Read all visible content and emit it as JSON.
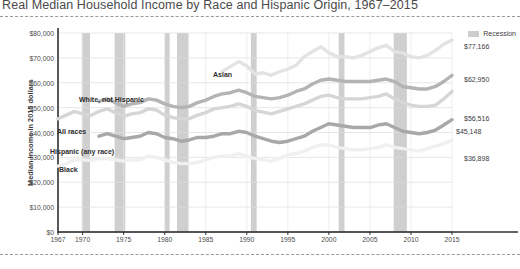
{
  "chart_data": {
    "type": "line",
    "title": "Real Median Household Income by Race and Hispanic Origin, 1967–2015",
    "xlabel": "",
    "ylabel": "Median income in 2015 dollars",
    "xlim": [
      1967,
      2015
    ],
    "ylim": [
      0,
      80000
    ],
    "grid": true,
    "legend_position": "top-right",
    "legend": [
      {
        "label": "Recession",
        "color": "#cdcdcd",
        "kind": "band"
      }
    ],
    "ytick_labels": [
      "$0",
      "$10,000",
      "$20,000",
      "$30,000",
      "$40,000",
      "$50,000",
      "$60,000",
      "$70,000",
      "$80,000"
    ],
    "ytick_values": [
      0,
      10000,
      20000,
      30000,
      40000,
      50000,
      60000,
      70000,
      80000
    ],
    "xtick_labels": [
      "1967",
      "1970",
      "1975",
      "1980",
      "1985",
      "1990",
      "1995",
      "2000",
      "2005",
      "2010",
      "2015"
    ],
    "xtick_values": [
      1967,
      1970,
      1975,
      1980,
      1985,
      1990,
      1995,
      2000,
      2005,
      2010,
      2015
    ],
    "recessions": [
      {
        "start": 1969.9,
        "end": 1970.9
      },
      {
        "start": 1973.9,
        "end": 1975.2
      },
      {
        "start": 1980.0,
        "end": 1980.6
      },
      {
        "start": 1981.5,
        "end": 1982.9
      },
      {
        "start": 1990.5,
        "end": 1991.2
      },
      {
        "start": 2001.2,
        "end": 2001.9
      },
      {
        "start": 2007.9,
        "end": 2009.5
      }
    ],
    "series": [
      {
        "name": "Asian",
        "color": "#e3e3e3",
        "end_value": 77166,
        "end_label": "$77,166",
        "x": [
          1987,
          1988,
          1989,
          1990,
          1991,
          1992,
          1993,
          1994,
          1995,
          1996,
          1997,
          1998,
          1999,
          2000,
          2001,
          2002,
          2003,
          2004,
          2005,
          2006,
          2007,
          2008,
          2009,
          2010,
          2011,
          2012,
          2013,
          2014,
          2015
        ],
        "values": [
          64500,
          66500,
          68500,
          66800,
          63500,
          64000,
          63000,
          64500,
          65500,
          67000,
          70500,
          72500,
          74500,
          72000,
          70500,
          70500,
          70000,
          71000,
          72500,
          74000,
          75000,
          72500,
          72000,
          70500,
          70000,
          71000,
          73000,
          75500,
          77166
        ]
      },
      {
        "name": "White, not Hispanic",
        "color": "#b4b4b4",
        "end_value": 62950,
        "end_label": "$62,950",
        "x": [
          1972,
          1973,
          1974,
          1975,
          1976,
          1977,
          1978,
          1979,
          1980,
          1981,
          1982,
          1983,
          1984,
          1985,
          1986,
          1987,
          1988,
          1989,
          1990,
          1991,
          1992,
          1993,
          1994,
          1995,
          1996,
          1997,
          1998,
          1999,
          2000,
          2001,
          2002,
          2003,
          2004,
          2005,
          2006,
          2007,
          2008,
          2009,
          2010,
          2011,
          2012,
          2013,
          2014,
          2015
        ],
        "values": [
          52500,
          53500,
          52000,
          50500,
          51500,
          52000,
          53500,
          53000,
          51500,
          50500,
          50000,
          50500,
          52000,
          53000,
          54500,
          55500,
          56000,
          57000,
          56000,
          54500,
          54000,
          53500,
          54000,
          55000,
          56500,
          57500,
          59500,
          61000,
          61500,
          61000,
          60500,
          60500,
          60500,
          60500,
          61000,
          61500,
          60500,
          58500,
          58000,
          57500,
          57500,
          58500,
          60500,
          62950
        ]
      },
      {
        "name": "All races",
        "color": "#d6d6d6",
        "end_value": 56516,
        "end_label": "$56,516",
        "x": [
          1967,
          1968,
          1969,
          1970,
          1971,
          1972,
          1973,
          1974,
          1975,
          1976,
          1977,
          1978,
          1979,
          1980,
          1981,
          1982,
          1983,
          1984,
          1985,
          1986,
          1987,
          1988,
          1989,
          1990,
          1991,
          1992,
          1993,
          1994,
          1995,
          1996,
          1997,
          1998,
          1999,
          2000,
          2001,
          2002,
          2003,
          2004,
          2005,
          2006,
          2007,
          2008,
          2009,
          2010,
          2011,
          2012,
          2013,
          2014,
          2015
        ],
        "values": [
          45500,
          47000,
          48500,
          47500,
          46800,
          48500,
          49500,
          48000,
          46500,
          47500,
          48000,
          49500,
          49000,
          47000,
          46000,
          45500,
          45500,
          47000,
          48000,
          49500,
          50000,
          50500,
          51500,
          50500,
          48800,
          48200,
          47500,
          48500,
          49500,
          50500,
          51500,
          53000,
          54500,
          55000,
          54000,
          53500,
          53500,
          53500,
          54000,
          54500,
          55500,
          53500,
          52000,
          51000,
          50500,
          50500,
          51000,
          53500,
          56516
        ]
      },
      {
        "name": "Hispanic (any race)",
        "color": "#a8a8a8",
        "end_value": 45148,
        "end_label": "$45,148",
        "x": [
          1972,
          1973,
          1974,
          1975,
          1976,
          1977,
          1978,
          1979,
          1980,
          1981,
          1982,
          1983,
          1984,
          1985,
          1986,
          1987,
          1988,
          1989,
          1990,
          1991,
          1992,
          1993,
          1994,
          1995,
          1996,
          1997,
          1998,
          1999,
          2000,
          2001,
          2002,
          2003,
          2004,
          2005,
          2006,
          2007,
          2008,
          2009,
          2010,
          2011,
          2012,
          2013,
          2014,
          2015
        ],
        "values": [
          38500,
          39500,
          38500,
          37500,
          38000,
          38500,
          40000,
          39500,
          38000,
          37500,
          36500,
          37000,
          38000,
          38000,
          38500,
          39500,
          39500,
          40500,
          40000,
          38500,
          37500,
          36500,
          36000,
          36500,
          37500,
          38500,
          40500,
          42000,
          43500,
          43000,
          42500,
          42000,
          42000,
          42000,
          43000,
          43500,
          42000,
          40500,
          40000,
          39500,
          40000,
          41000,
          43000,
          45148
        ]
      },
      {
        "name": "Black",
        "color": "#f0f0f0",
        "end_value": 36898,
        "end_label": "$36,898",
        "x": [
          1967,
          1968,
          1969,
          1970,
          1971,
          1972,
          1973,
          1974,
          1975,
          1976,
          1977,
          1978,
          1979,
          1980,
          1981,
          1982,
          1983,
          1984,
          1985,
          1986,
          1987,
          1988,
          1989,
          1990,
          1991,
          1992,
          1993,
          1994,
          1995,
          1996,
          1997,
          1998,
          1999,
          2000,
          2001,
          2002,
          2003,
          2004,
          2005,
          2006,
          2007,
          2008,
          2009,
          2010,
          2011,
          2012,
          2013,
          2014,
          2015
        ],
        "values": [
          26500,
          27500,
          29000,
          29000,
          28800,
          29500,
          29500,
          29000,
          28500,
          29000,
          29000,
          30500,
          30000,
          29000,
          28000,
          27500,
          27500,
          28000,
          29000,
          30000,
          30500,
          30500,
          31500,
          30500,
          29500,
          29000,
          28500,
          29500,
          31000,
          31500,
          32500,
          34000,
          35000,
          35000,
          34000,
          33500,
          33000,
          33000,
          33500,
          34000,
          35000,
          34000,
          33500,
          33000,
          32500,
          33500,
          34500,
          35500,
          36898
        ]
      }
    ],
    "series_labels": [
      {
        "name": "Asian",
        "text": "Asian",
        "x_px": 213,
        "y_px": 71
      },
      {
        "name": "White, not Hispanic",
        "text": "White, not Hispanic",
        "x_px": 79,
        "y_px": 96
      },
      {
        "name": "All races",
        "text": "All races",
        "x_px": 57,
        "y_px": 128
      },
      {
        "name": "Hispanic (any race)",
        "text": "Hispanic (any race)",
        "x_px": 50,
        "y_px": 148
      },
      {
        "name": "Black",
        "text": "Black",
        "x_px": 59,
        "y_px": 166
      }
    ],
    "end_labels": [
      {
        "name": "Asian",
        "text": "$77,166",
        "x_px": 464,
        "y_px": 43
      },
      {
        "name": "White, not Hispanic",
        "text": "$62,950",
        "x_px": 464,
        "y_px": 76
      },
      {
        "name": "All races",
        "text": "$56,516",
        "x_px": 464,
        "y_px": 115
      },
      {
        "name": "Hispanic (any race)",
        "text": "$45,148",
        "x_px": 456,
        "y_px": 128
      },
      {
        "name": "Black",
        "text": "$36,898",
        "x_px": 464,
        "y_px": 155
      }
    ]
  }
}
